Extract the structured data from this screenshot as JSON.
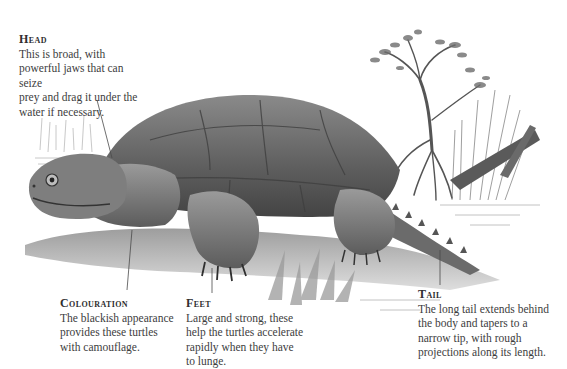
{
  "illustration": {
    "subject": "snapping turtle on a riverbank",
    "style": "grayscale pencil drawing",
    "colors": {
      "background": "#ffffff",
      "text": "#3d3d3d",
      "heading": "#2e2e2e",
      "leader_line": "#4a4a4a",
      "shell_dark": "#5a5a5a",
      "shell_mid": "#7d7d7d",
      "skin_light": "#a8a8a8"
    }
  },
  "callouts": {
    "head": {
      "heading": "Head",
      "body_lines": [
        "This is broad, with",
        "powerful jaws that can seize",
        "prey and drag it under the",
        "water if necessary."
      ]
    },
    "colouration": {
      "heading": "Colouration",
      "body_lines": [
        "The blackish appearance",
        "provides these turtles",
        "with camouflage."
      ]
    },
    "feet": {
      "heading": "Feet",
      "body_lines": [
        "Large and strong, these",
        "help the turtles accelerate",
        "rapidly when they have",
        "to lunge."
      ]
    },
    "tail": {
      "heading": "Tail",
      "body_lines": [
        "The long tail extends behind",
        "the body and tapers to a",
        "narrow tip, with rough",
        "projections along its length."
      ]
    }
  }
}
